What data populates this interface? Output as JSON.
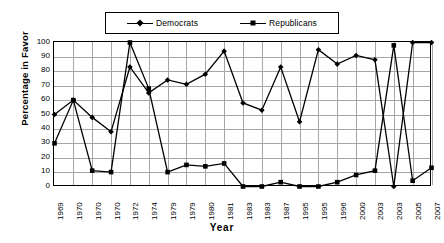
{
  "chart_data": {
    "type": "line",
    "title": "",
    "xlabel": "Year",
    "ylabel": "Percentage in Favor",
    "ylim": [
      0,
      100
    ],
    "ytick_step": 10,
    "yticks": [
      100,
      90,
      80,
      70,
      60,
      50,
      40,
      30,
      20,
      10,
      0
    ],
    "grid": true,
    "legend_position": "top-center",
    "categories": [
      "1969",
      "1970",
      "1970",
      "1970",
      "1972",
      "1974",
      "1979",
      "1979",
      "1980",
      "1981",
      "1983",
      "1983",
      "1987",
      "1995",
      "1995",
      "1996",
      "2000",
      "2003",
      "2003",
      "2005",
      "2007"
    ],
    "series": [
      {
        "name": "Democrats",
        "marker": "diamond",
        "color": "#000000",
        "values": [
          50,
          60,
          48,
          38,
          83,
          65,
          74,
          71,
          78,
          94,
          58,
          53,
          83,
          45,
          95,
          85,
          91,
          88,
          0,
          100,
          100
        ]
      },
      {
        "name": "Republicans",
        "marker": "square",
        "color": "#000000",
        "values": [
          30,
          60,
          11,
          10,
          100,
          68,
          10,
          15,
          14,
          16,
          0,
          0,
          3,
          0,
          0,
          3,
          8,
          11,
          98,
          4,
          13
        ]
      }
    ]
  },
  "legend": {
    "items": [
      {
        "label": "Democrats",
        "marker": "diamond"
      },
      {
        "label": "Republicans",
        "marker": "square"
      }
    ]
  },
  "axes": {
    "x_title": "Year",
    "y_title": "Percentage in Favor"
  }
}
